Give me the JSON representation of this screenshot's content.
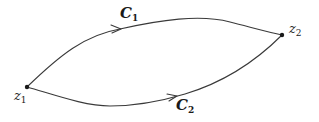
{
  "diagram": {
    "type": "contour-paths",
    "points": [
      {
        "id": "z1",
        "label": "z",
        "subscript": "1",
        "x": 27,
        "y": 87
      },
      {
        "id": "z2",
        "label": "z",
        "subscript": "2",
        "x": 282,
        "y": 35
      }
    ],
    "paths": [
      {
        "id": "C1",
        "label": "C",
        "subscript": "1",
        "from": "z1",
        "to": "z2",
        "position": "upper",
        "direction": "z1-to-z2"
      },
      {
        "id": "C2",
        "label": "C",
        "subscript": "2",
        "from": "z1",
        "to": "z2",
        "position": "lower",
        "direction": "z1-to-z2"
      }
    ],
    "colors": {
      "stroke": "#3a3a3a",
      "point": "#1a1a1a",
      "background": "#ffffff"
    }
  }
}
